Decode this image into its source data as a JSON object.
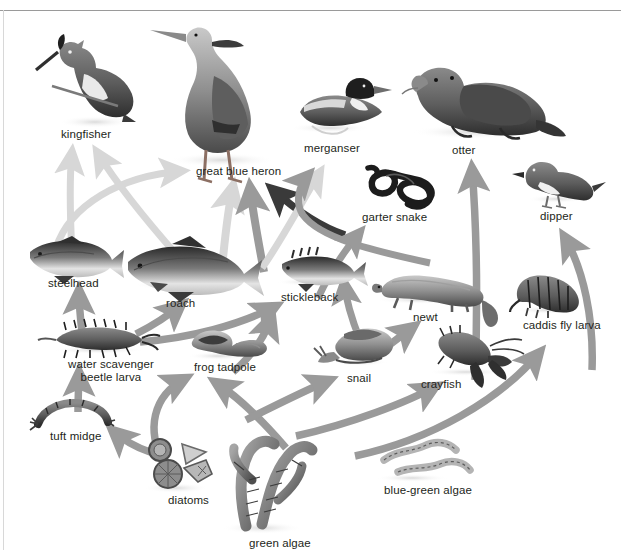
{
  "diagram": {
    "type": "food-web",
    "background_color": "#ffffff",
    "text_color": "#231f20",
    "arrow_colors": {
      "light": "#d7d7d7",
      "medium": "#9a9a9a",
      "dark": "#3a3a3a"
    }
  },
  "organisms": [
    {
      "id": "kingfisher",
      "label": "kingfisher",
      "x": 61,
      "y": 128,
      "trophic": "consumer"
    },
    {
      "id": "great-blue-heron",
      "label": "great blue heron",
      "x": 196,
      "y": 165,
      "trophic": "consumer"
    },
    {
      "id": "merganser",
      "label": "merganser",
      "x": 304,
      "y": 142,
      "trophic": "consumer"
    },
    {
      "id": "otter",
      "label": "otter",
      "x": 452,
      "y": 144,
      "trophic": "consumer"
    },
    {
      "id": "garter-snake",
      "label": "garter snake",
      "x": 362,
      "y": 211,
      "trophic": "consumer"
    },
    {
      "id": "dipper",
      "label": "dipper",
      "x": 540,
      "y": 210,
      "trophic": "consumer"
    },
    {
      "id": "steelhead",
      "label": "steelhead",
      "x": 48,
      "y": 277,
      "trophic": "consumer"
    },
    {
      "id": "roach",
      "label": "roach",
      "x": 166,
      "y": 297,
      "trophic": "consumer"
    },
    {
      "id": "stickleback",
      "label": "stickleback",
      "x": 281,
      "y": 291,
      "trophic": "consumer"
    },
    {
      "id": "newt",
      "label": "newt",
      "x": 413,
      "y": 311,
      "trophic": "consumer"
    },
    {
      "id": "caddis-fly-larva",
      "label": "caddis fly larva",
      "x": 523,
      "y": 319,
      "trophic": "consumer"
    },
    {
      "id": "water-scavenger-beetle-larva",
      "label": "water scavenger\nbeetle larva",
      "x": 68,
      "y": 358,
      "trophic": "consumer"
    },
    {
      "id": "frog-tadpole",
      "label": "frog tadpole",
      "x": 194,
      "y": 361,
      "trophic": "consumer"
    },
    {
      "id": "snail",
      "label": "snail",
      "x": 347,
      "y": 372,
      "trophic": "consumer"
    },
    {
      "id": "crayfish",
      "label": "crayfish",
      "x": 421,
      "y": 378,
      "trophic": "consumer"
    },
    {
      "id": "tuft-midge",
      "label": "tuft midge",
      "x": 50,
      "y": 430,
      "trophic": "consumer"
    },
    {
      "id": "diatoms",
      "label": "diatoms",
      "x": 168,
      "y": 494,
      "trophic": "producer"
    },
    {
      "id": "green-algae",
      "label": "green algae",
      "x": 249,
      "y": 537,
      "trophic": "producer"
    },
    {
      "id": "blue-green-algae",
      "label": "blue-green algae",
      "x": 384,
      "y": 484,
      "trophic": "producer"
    }
  ],
  "links": [
    {
      "from": "steelhead",
      "to": "kingfisher",
      "shade": "light"
    },
    {
      "from": "roach",
      "to": "kingfisher",
      "shade": "light"
    },
    {
      "from": "steelhead",
      "to": "great-blue-heron",
      "shade": "light"
    },
    {
      "from": "roach",
      "to": "great-blue-heron",
      "shade": "light"
    },
    {
      "from": "stickleback",
      "to": "great-blue-heron",
      "shade": "medium"
    },
    {
      "from": "newt",
      "to": "great-blue-heron",
      "shade": "dark"
    },
    {
      "from": "stickleback",
      "to": "merganser",
      "shade": "light"
    },
    {
      "from": "newt",
      "to": "merganser",
      "shade": "medium"
    },
    {
      "from": "snail",
      "to": "stickleback",
      "shade": "medium"
    },
    {
      "from": "water-scavenger-beetle-larva",
      "to": "steelhead",
      "shade": "medium"
    },
    {
      "from": "water-scavenger-beetle-larva",
      "to": "roach",
      "shade": "medium"
    },
    {
      "from": "water-scavenger-beetle-larva",
      "to": "stickleback",
      "shade": "medium"
    },
    {
      "from": "tuft-midge",
      "to": "water-scavenger-beetle-larva",
      "shade": "medium"
    },
    {
      "from": "diatoms",
      "to": "tuft-midge",
      "shade": "medium"
    },
    {
      "from": "diatoms",
      "to": "frog-tadpole",
      "shade": "medium"
    },
    {
      "from": "green-algae",
      "to": "frog-tadpole",
      "shade": "medium"
    },
    {
      "from": "frog-tadpole",
      "to": "stickleback",
      "shade": "medium"
    },
    {
      "from": "snail",
      "to": "newt",
      "shade": "medium"
    },
    {
      "from": "green-algae",
      "to": "snail",
      "shade": "medium"
    },
    {
      "from": "green-algae",
      "to": "crayfish",
      "shade": "medium"
    },
    {
      "from": "blue-green-algae",
      "to": "caddis-fly-larva",
      "shade": "medium"
    },
    {
      "from": "crayfish",
      "to": "otter",
      "shade": "medium"
    },
    {
      "from": "caddis-fly-larva",
      "to": "dipper",
      "shade": "medium"
    },
    {
      "from": "newt",
      "to": "garter-snake",
      "shade": "medium"
    }
  ]
}
